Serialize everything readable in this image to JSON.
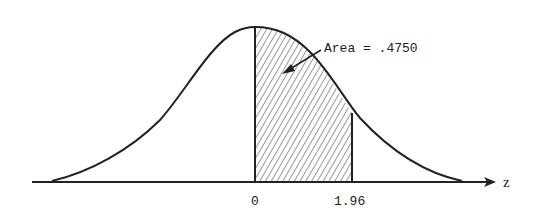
{
  "diagram": {
    "type": "normal-distribution-shaded-area",
    "annotation": {
      "text": "Area = .4750"
    },
    "axis": {
      "label": "z",
      "ticks": [
        {
          "label": "0",
          "value": 0
        },
        {
          "label": "1.96",
          "value": 1.96
        }
      ]
    },
    "shaded_region": {
      "from": 0,
      "to": 1.96,
      "area": 0.475
    },
    "colors": {
      "stroke": "#222222",
      "background": "#ffffff"
    }
  }
}
